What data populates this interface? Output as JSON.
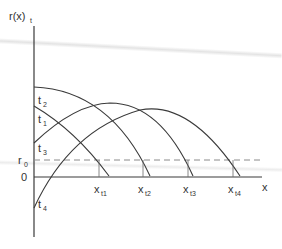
{
  "diagram": {
    "y_axis_label": "r(x)",
    "y_axis_label_sub": "t",
    "x_axis_label": "x",
    "origin_label": "0",
    "threshold_label": "r",
    "threshold_label_sub": "0",
    "curves": [
      {
        "label": "t",
        "sub": "1"
      },
      {
        "label": "t",
        "sub": "2"
      },
      {
        "label": "t",
        "sub": "3"
      },
      {
        "label": "t",
        "sub": "4"
      }
    ],
    "x_marks": [
      {
        "label": "x",
        "sub": "t1",
        "subsub": "1"
      },
      {
        "label": "x",
        "sub": "t2",
        "subsub": "2"
      },
      {
        "label": "x",
        "sub": "t3",
        "subsub": "3"
      },
      {
        "label": "x",
        "sub": "t4",
        "subsub": "4"
      }
    ],
    "colors": {
      "line": "#3a3a3a",
      "dashed": "#8a8a8a",
      "text": "#333333",
      "background": "#ffffff"
    }
  }
}
